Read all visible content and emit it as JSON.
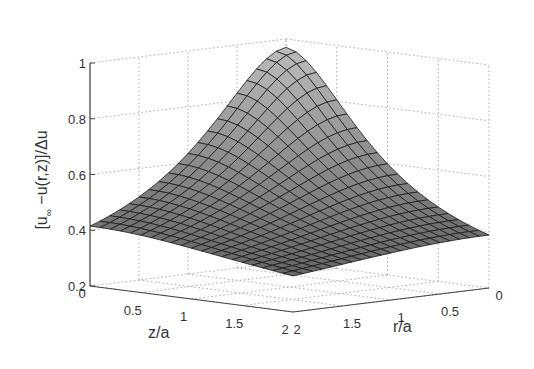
{
  "chart_data": {
    "type": "surface3d",
    "title": "",
    "xlabel": "z/a",
    "ylabel": "r/a",
    "zlabel": "[u_∞ −u(r,z)]/Δu",
    "zlabel_parts": {
      "open": "[u",
      "sub": "∞",
      "rest": " −u(r,z)]/Δu"
    },
    "x_ticks": [
      "0",
      "0.5",
      "1",
      "1.5",
      "2"
    ],
    "y_ticks": [
      "0",
      "0.5",
      "1",
      "1.5",
      "2"
    ],
    "z_ticks": [
      "0.2",
      "0.4",
      "0.6",
      "0.8",
      "1"
    ],
    "xlim": [
      0,
      2
    ],
    "ylim": [
      0,
      2
    ],
    "zlim": [
      0.2,
      1
    ],
    "grid": true,
    "mesh_resolution": 20,
    "colormap": "gray",
    "corner_values": {
      "z0_r0": 0.97,
      "z0_r2": 0.32,
      "z2_r0": 0.3,
      "z2_r2": 0.22
    },
    "sample_profile_r0": {
      "z": [
        0,
        0.5,
        1,
        1.5,
        2
      ],
      "u": [
        0.97,
        0.72,
        0.5,
        0.37,
        0.3
      ]
    },
    "sample_profile_z0": {
      "r": [
        0,
        0.5,
        1,
        1.5,
        2
      ],
      "u": [
        0.97,
        0.86,
        0.55,
        0.4,
        0.32
      ]
    }
  },
  "colors": {
    "axis": "#444444",
    "grid": "#aaaaaa",
    "mesh_line": "#1a1a1a",
    "surface_light": "#b8b8b8",
    "surface_dark": "#5a5a5a"
  }
}
